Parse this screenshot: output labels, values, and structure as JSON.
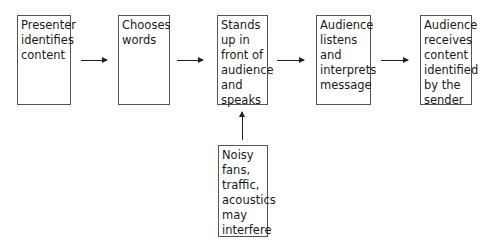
{
  "diagram": {
    "steps": [
      {
        "id": "step1",
        "label": "Presenter identifies content",
        "lines": [
          "Presenter",
          "identifies",
          "content"
        ]
      },
      {
        "id": "step2",
        "label": "Chooses words",
        "lines": [
          "Chooses",
          "words"
        ]
      },
      {
        "id": "step3",
        "label": "Stands up in front of audience and speaks",
        "lines": [
          "Stands",
          "up in",
          "front of",
          "audience",
          "and",
          "speaks"
        ]
      },
      {
        "id": "step4",
        "label": "Audience listens and interprets message",
        "lines": [
          "Audience",
          "listens",
          "and",
          "interprets",
          "message"
        ]
      },
      {
        "id": "step5",
        "label": "Audience receives content identified by the sender",
        "lines": [
          "Audience",
          "receives",
          "content",
          "identified",
          "by the",
          "sender"
        ]
      }
    ],
    "interference": {
      "label": "Noisy fans, traffic, acoustics may interfere",
      "lines": [
        "Noisy",
        "fans,",
        "traffic,",
        "acoustics",
        "may",
        "interfere"
      ]
    },
    "connections": [
      {
        "from": "step1",
        "to": "step2"
      },
      {
        "from": "step2",
        "to": "step3"
      },
      {
        "from": "step3",
        "to": "step4"
      },
      {
        "from": "step4",
        "to": "step5"
      },
      {
        "from": "interference",
        "to": "step3"
      }
    ]
  }
}
